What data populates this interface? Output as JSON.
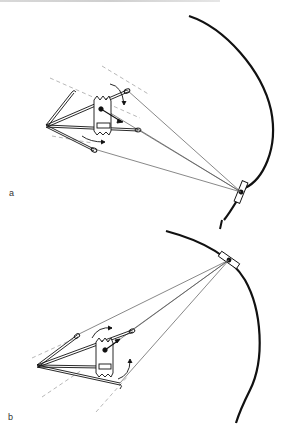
{
  "figure": {
    "panels": [
      {
        "label": "a",
        "description": "Headgear force diagram: face-bow with inner and outer bows, molar tooth, rotation arrows, force lines converging to neck/head strap attachment on curved profile"
      },
      {
        "label": "b",
        "description": "Headgear force diagram: face-bow with inner and outer bows, molar tooth, rotation arrows, force lines converging to head strap attachment on curved profile"
      }
    ],
    "colors": {
      "line": "#111111",
      "thin_line": "#555555",
      "dashed_line": "#9a9a9a",
      "background": "#ffffff"
    }
  }
}
